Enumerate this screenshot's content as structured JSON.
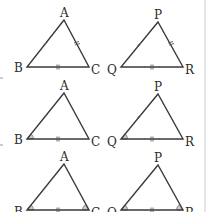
{
  "diagram": {
    "colors": {
      "edge": "#3a3a3a",
      "angle_fill": "#c9c9c9",
      "label": "#2b2b2b",
      "background": "#ffffff"
    },
    "rows": [
      {
        "criterion": "SSS",
        "left": {
          "vertices": {
            "top": "A",
            "left": "B",
            "right": "C"
          },
          "marked_sides": [
            "AB",
            "AC",
            "BC"
          ],
          "marked_angles": []
        },
        "right": {
          "vertices": {
            "top": "P",
            "left": "Q",
            "right": "R"
          },
          "marked_sides": [
            "PQ",
            "PR",
            "QR"
          ],
          "marked_angles": []
        }
      },
      {
        "criterion": "SAS",
        "left": {
          "vertices": {
            "top": "A",
            "left": "B",
            "right": "C"
          },
          "marked_sides": [
            "AB",
            "BC"
          ],
          "marked_angles": [
            "B"
          ]
        },
        "right": {
          "vertices": {
            "top": "P",
            "left": "Q",
            "right": "R"
          },
          "marked_sides": [
            "PQ",
            "QR"
          ],
          "marked_angles": [
            "Q"
          ]
        }
      },
      {
        "criterion": "ASA",
        "left": {
          "vertices": {
            "top": "A",
            "left": "B",
            "right": "C"
          },
          "marked_sides": [
            "BC"
          ],
          "marked_angles": [
            "B",
            "C"
          ]
        },
        "right": {
          "vertices": {
            "top": "P",
            "left": "Q",
            "right": "R"
          },
          "marked_sides": [
            "QR"
          ],
          "marked_angles": [
            "Q",
            "R"
          ]
        }
      }
    ]
  }
}
